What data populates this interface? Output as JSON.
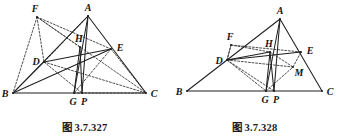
{
  "page": {
    "background_color": "#ffffff",
    "stroke_color": "#202020",
    "dotted_color": "#3a3a3a",
    "width": 339,
    "height": 140
  },
  "figures": [
    {
      "id": "figure-327",
      "caption": "图 3.7.327",
      "caption_number": "3.7.327",
      "caption_prefix": "图",
      "points": {
        "A": {
          "label": "A",
          "x": 88,
          "y": 16
        },
        "B": {
          "label": "B",
          "x": 13,
          "y": 93
        },
        "C": {
          "label": "C",
          "x": 146,
          "y": 93
        },
        "D": {
          "label": "D",
          "x": 44,
          "y": 62
        },
        "E": {
          "label": "E",
          "x": 111,
          "y": 49
        },
        "F": {
          "label": "F",
          "x": 37,
          "y": 17
        },
        "H": {
          "label": "H",
          "x": 80,
          "y": 47
        },
        "G": {
          "label": "G",
          "x": 74,
          "y": 93
        },
        "P": {
          "label": "P",
          "x": 82,
          "y": 93
        }
      },
      "label_offsets": {
        "A": {
          "dx": 0,
          "dy": -8
        },
        "B": {
          "dx": -8,
          "dy": 1
        },
        "C": {
          "dx": 8,
          "dy": 1
        },
        "D": {
          "dx": -8,
          "dy": 0
        },
        "E": {
          "dx": 9,
          "dy": -1
        },
        "F": {
          "dx": -2,
          "dy": -8
        },
        "H": {
          "dx": -1,
          "dy": -8
        },
        "G": {
          "dx": -1,
          "dy": 9
        },
        "P": {
          "dx": 2,
          "dy": 9
        }
      },
      "solid_segments": [
        [
          "B",
          "C"
        ],
        [
          "B",
          "A"
        ],
        [
          "A",
          "C"
        ],
        [
          "A",
          "G"
        ],
        [
          "A",
          "P"
        ],
        [
          "B",
          "E"
        ],
        [
          "D",
          "E"
        ],
        [
          "H",
          "G"
        ],
        [
          "H",
          "P"
        ],
        [
          "D",
          "B"
        ]
      ],
      "dotted_segments": [
        [
          "F",
          "B"
        ],
        [
          "F",
          "D"
        ],
        [
          "F",
          "E"
        ],
        [
          "F",
          "H"
        ],
        [
          "F",
          "C"
        ],
        [
          "D",
          "C"
        ],
        [
          "D",
          "A"
        ],
        [
          "A",
          "D"
        ],
        [
          "E",
          "G"
        ],
        [
          "G",
          "C"
        ],
        [
          "D",
          "P"
        ],
        [
          "E",
          "C"
        ]
      ]
    },
    {
      "id": "figure-328",
      "caption": "图 3.7.328",
      "caption_number": "3.7.328",
      "caption_prefix": "图",
      "points": {
        "A": {
          "label": "A",
          "x": 110,
          "y": 19
        },
        "B": {
          "label": "B",
          "x": 17,
          "y": 91
        },
        "C": {
          "label": "C",
          "x": 152,
          "y": 91
        },
        "D": {
          "label": "D",
          "x": 57,
          "y": 60
        },
        "E": {
          "label": "E",
          "x": 131,
          "y": 52
        },
        "F": {
          "label": "F",
          "x": 61,
          "y": 45
        },
        "H": {
          "label": "H",
          "x": 100,
          "y": 52
        },
        "M": {
          "label": "M",
          "x": 123,
          "y": 67
        },
        "G": {
          "label": "G",
          "x": 96,
          "y": 91
        },
        "P": {
          "label": "P",
          "x": 104,
          "y": 91
        }
      },
      "label_offsets": {
        "A": {
          "dx": 0,
          "dy": -8
        },
        "B": {
          "dx": -8,
          "dy": 1
        },
        "C": {
          "dx": 8,
          "dy": 1
        },
        "D": {
          "dx": -8,
          "dy": 1
        },
        "E": {
          "dx": 9,
          "dy": -1
        },
        "F": {
          "dx": -1,
          "dy": -8
        },
        "H": {
          "dx": -1,
          "dy": -8
        },
        "M": {
          "dx": 6,
          "dy": 6
        },
        "G": {
          "dx": -1,
          "dy": 9
        },
        "P": {
          "dx": 2,
          "dy": 9
        }
      },
      "solid_segments": [
        [
          "B",
          "C"
        ],
        [
          "B",
          "A"
        ],
        [
          "A",
          "C"
        ],
        [
          "A",
          "G"
        ],
        [
          "A",
          "P"
        ],
        [
          "D",
          "E"
        ],
        [
          "H",
          "G"
        ],
        [
          "H",
          "P"
        ],
        [
          "D",
          "H"
        ]
      ],
      "dotted_segments": [
        [
          "D",
          "F"
        ],
        [
          "F",
          "H"
        ],
        [
          "F",
          "E"
        ],
        [
          "D",
          "M"
        ],
        [
          "M",
          "E"
        ],
        [
          "D",
          "G"
        ],
        [
          "G",
          "M"
        ],
        [
          "D",
          "P"
        ],
        [
          "H",
          "M"
        ],
        [
          "F",
          "D"
        ]
      ]
    }
  ]
}
